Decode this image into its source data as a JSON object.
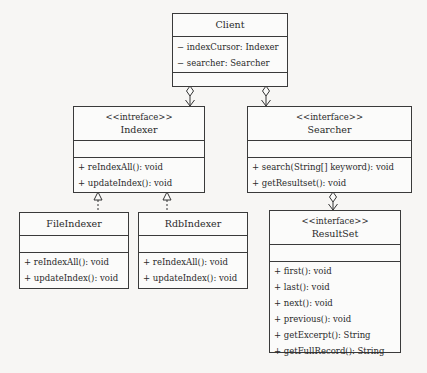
{
  "diagram": {
    "type": "UML class diagram",
    "classes": {
      "client": {
        "name": "Client",
        "stereotype": "",
        "attributes": [
          "− indexCursor: Indexer",
          "− searcher: Searcher"
        ],
        "methods": []
      },
      "indexer": {
        "name": "Indexer",
        "stereotype": "<<intreface>>",
        "attributes": [],
        "methods": [
          "+ reIndexAll(): void",
          "+ updateIndex(): void"
        ]
      },
      "searcher": {
        "name": "Searcher",
        "stereotype": "<<interface>>",
        "attributes": [],
        "methods": [
          "+ search(String[] keyword): void",
          "+ getResultset(): void"
        ]
      },
      "file_indexer": {
        "name": "FileIndexer",
        "stereotype": "",
        "attributes": [],
        "methods": [
          "+ reIndexAll(): void",
          "+ updateIndex(): void"
        ]
      },
      "rdb_indexer": {
        "name": "RdbIndexer",
        "stereotype": "",
        "attributes": [],
        "methods": [
          "+ reIndexAll(): void",
          "+ updateIndex(): void"
        ]
      },
      "result_set": {
        "name": "ResultSet",
        "stereotype": "<<interface>>",
        "attributes": [],
        "methods": [
          "+ first(): void",
          "+ last(): void",
          "+ next(): void",
          "+ previous(): void",
          "+ getExcerpt(): String",
          "+ getFullRecord(): String"
        ]
      }
    },
    "relationships": [
      {
        "from": "Client",
        "to": "Indexer",
        "kind": "aggregation"
      },
      {
        "from": "Client",
        "to": "Searcher",
        "kind": "aggregation"
      },
      {
        "from": "Searcher",
        "to": "ResultSet",
        "kind": "aggregation"
      },
      {
        "from": "FileIndexer",
        "to": "Indexer",
        "kind": "realization"
      },
      {
        "from": "RdbIndexer",
        "to": "Indexer",
        "kind": "realization"
      }
    ]
  }
}
